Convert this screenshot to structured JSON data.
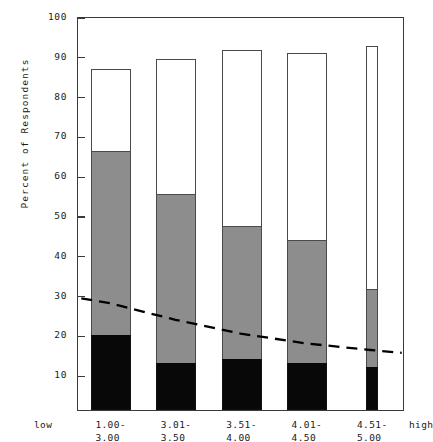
{
  "chart_data": {
    "type": "bar",
    "title": "",
    "subtitle": "",
    "xlabel": "",
    "ylabel": "Percent of Respondents",
    "ylim": [
      0,
      100
    ],
    "yticks": [
      100,
      90,
      80,
      70,
      60,
      50,
      40,
      30,
      20,
      10
    ],
    "grid": false,
    "legend_position": "none",
    "stacked": true,
    "categories": [
      "1.00-\n3.00",
      "3.01-\n3.50",
      "3.51-\n4.00",
      "4.01-\n4.50",
      "4.51-\n5.00"
    ],
    "category_lines": [
      [
        "1.00-",
        "3.00"
      ],
      [
        "3.01-",
        "3.50"
      ],
      [
        "3.51-",
        "4.00"
      ],
      [
        "4.01-",
        "4.50"
      ],
      [
        "4.51-",
        "5.00"
      ]
    ],
    "axis_end_labels": {
      "left": "low",
      "right": "high"
    },
    "series": [
      {
        "name": "black-segment",
        "color": "#080808",
        "values": [
          19,
          12,
          13,
          12,
          11
        ]
      },
      {
        "name": "gray-segment",
        "color": "#8d8d8d",
        "values": [
          46.5,
          42.5,
          33.5,
          31,
          19.5
        ]
      },
      {
        "name": "white-segment",
        "color": "#ffffff",
        "values": [
          21,
          34.5,
          45,
          47.5,
          62
        ]
      }
    ],
    "segment_tops": {
      "black": [
        19,
        12,
        13,
        12,
        11
      ],
      "gray": [
        65.5,
        54.5,
        46.5,
        43,
        30.5
      ],
      "total": [
        86.5,
        89,
        91.5,
        90.5,
        92.5
      ]
    },
    "overlay_line": {
      "name": "dashed-trend-line",
      "style": "dashed",
      "color": "#000000",
      "x_positions": [
        0.05,
        0.5,
        1.5,
        2.5,
        3.5,
        4.5,
        4.98
      ],
      "values": [
        28.5,
        27.2,
        23.0,
        19.5,
        17.0,
        15.3,
        14.6
      ]
    },
    "bar_widths": {
      "wide": 1.0,
      "narrow": 0.18,
      "narrow_index": 4
    },
    "colors": {
      "axis": "#3a3a3a",
      "bar_outline": "#4a4a4a",
      "black_fill": "#080808",
      "gray_fill": "#8d8d8d",
      "white_fill": "#ffffff",
      "text": "#1a1a1a",
      "trend": "#000000"
    }
  }
}
